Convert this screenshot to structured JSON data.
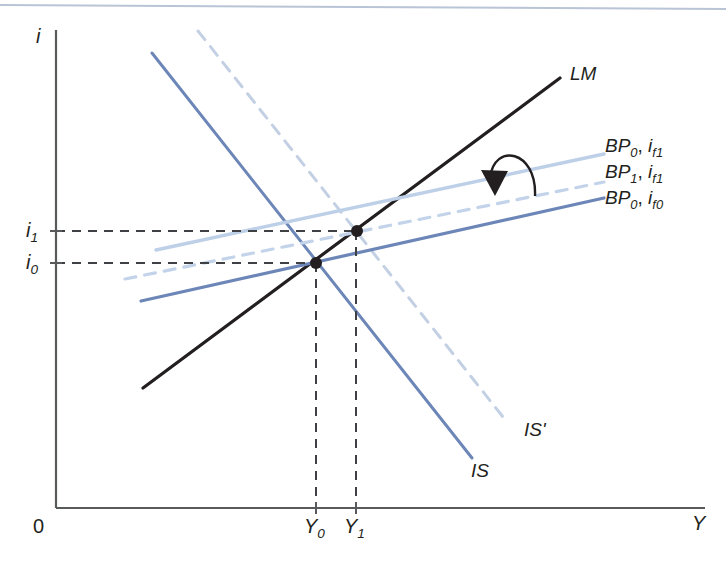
{
  "figure": {
    "kind": "is-lm-bp-diagram",
    "background": "#ffffff",
    "width": 726,
    "height": 568,
    "top_rule_color": "#b9c4d6",
    "axis_color": "#58595b"
  },
  "axes": {
    "y_label": "i",
    "x_label": "Y",
    "origin_label": "0",
    "y_ticks": [
      {
        "id": "i1",
        "base": "i",
        "sub": "1",
        "y": 231
      },
      {
        "id": "i0",
        "base": "i",
        "sub": "0",
        "y": 263
      }
    ],
    "x_ticks": [
      {
        "id": "Y0",
        "base": "Y",
        "sub": "0",
        "x": 316
      },
      {
        "id": "Y1",
        "base": "Y",
        "sub": "1",
        "x": 356
      }
    ]
  },
  "curves": [
    {
      "id": "lm",
      "label": "LM",
      "color": "#231f20",
      "style": "solid",
      "width": 3.2,
      "x1": 143,
      "y1": 388,
      "x2": 560,
      "y2": 78
    },
    {
      "id": "is",
      "label": "IS",
      "color": "#6d86b8",
      "style": "solid",
      "width": 3.0,
      "x1": 152,
      "y1": 53,
      "x2": 472,
      "y2": 458
    },
    {
      "id": "is_prime",
      "label": "IS'",
      "color": "#c3d0e4",
      "style": "dashed",
      "width": 3.0,
      "x1": 198,
      "y1": 31,
      "x2": 503,
      "y2": 417
    },
    {
      "id": "bp0_if1",
      "label_base": "BP",
      "label_sub": "0",
      "label_base2": "i",
      "label_sub2": "f1",
      "color": "#bdd0e8",
      "style": "solid",
      "width": 3.4,
      "x1": 156,
      "y1": 250,
      "x2": 604,
      "y2": 154
    },
    {
      "id": "bp1_if1",
      "label_base": "BP",
      "label_sub": "1",
      "label_base2": "i",
      "label_sub2": "f1",
      "color": "#c3d4ea",
      "style": "dashed",
      "width": 3.2,
      "x1": 125,
      "y1": 279,
      "x2": 604,
      "y2": 182
    },
    {
      "id": "bp0_if0",
      "label_base": "BP",
      "label_sub": "0",
      "label_base2": "i",
      "label_sub2": "f0",
      "color": "#6d86b8",
      "style": "solid",
      "width": 3.2,
      "x1": 141,
      "y1": 301,
      "x2": 604,
      "y2": 198
    }
  ],
  "legend": [
    {
      "id": "legend-bp0-if1",
      "base": "BP",
      "sub": "0",
      "base2": "i",
      "sub2": "f1",
      "x": 600,
      "y": 146
    },
    {
      "id": "legend-bp1-if1",
      "base": "BP",
      "sub": "1",
      "base2": "i",
      "sub2": "f1",
      "x": 600,
      "y": 172
    },
    {
      "id": "legend-bp0-if0",
      "base": "BP",
      "sub": "0",
      "base2": "i",
      "sub2": "f0",
      "x": 600,
      "y": 198
    }
  ],
  "curve_labels": [
    {
      "id": "label-lm",
      "text": "LM",
      "x": 570,
      "y": 64
    },
    {
      "id": "label-is-prime",
      "text": "IS'",
      "x": 524,
      "y": 420
    },
    {
      "id": "label-is",
      "text": "IS",
      "x": 471,
      "y": 461
    }
  ],
  "points": [
    {
      "id": "equilibrium-0",
      "x": 316,
      "y": 263,
      "r": 6,
      "color": "#231f20"
    },
    {
      "id": "equilibrium-1",
      "x": 357,
      "y": 231,
      "r": 6,
      "color": "#231f20"
    }
  ],
  "guides": {
    "color": "#3f4044",
    "dash": "9,7",
    "width": 2,
    "horizontal": [
      {
        "id": "guide-i1",
        "x1": 56,
        "y1": 231,
        "x2": 357,
        "y2": 231
      },
      {
        "id": "guide-i0",
        "x1": 56,
        "y1": 263,
        "x2": 316,
        "y2": 263
      }
    ],
    "vertical": [
      {
        "id": "guide-Y0",
        "x1": 316,
        "y1": 263,
        "x2": 316,
        "y2": 508
      },
      {
        "id": "guide-Y1",
        "x1": 356,
        "y1": 231,
        "x2": 356,
        "y2": 508
      }
    ]
  },
  "arrow": {
    "id": "shift-arrow",
    "color": "#231f20",
    "path": "M 535 196 C 537 150 494 142 490 178",
    "head": "495,196 481,170 508,171"
  },
  "axis_geometry": {
    "y_axis": {
      "x": 56,
      "y_top": 30,
      "y_bottom": 508
    },
    "x_axis": {
      "y": 508,
      "x_left": 56,
      "x_right": 705
    },
    "top_rule": {
      "x1": 0,
      "y1": 5,
      "x2": 726,
      "y2": 9
    }
  }
}
